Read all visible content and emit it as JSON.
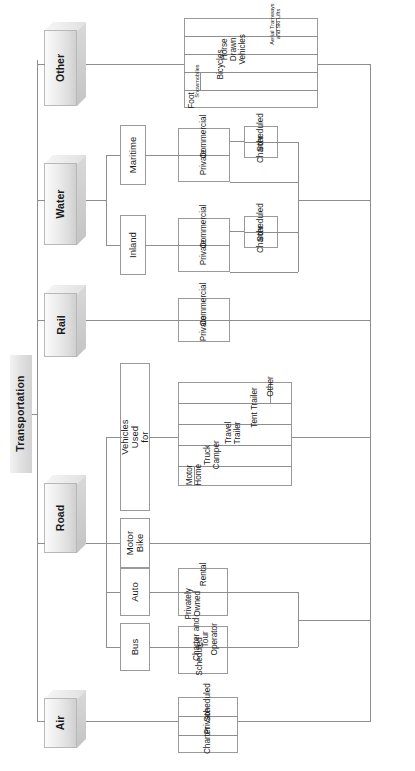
{
  "diagram": {
    "title": "Transportation",
    "orientation": "rotated-90",
    "type": "hierarchy-tree",
    "root": "Transportation",
    "colors": {
      "line": "#8e8e8e",
      "box_border": "#9a9a9a",
      "box_fill": "#ffffff",
      "level1_fill": "#e6e6e6",
      "text": "#1a1a1a"
    },
    "branches": [
      {
        "label": "Air",
        "children": [],
        "leaves": [
          "Charter",
          "Private",
          "Scheduled"
        ]
      },
      {
        "label": "Road",
        "children": [
          {
            "label": "Bus",
            "leaves": [
              "Scheduled",
              "Charter and Tour Operator"
            ]
          },
          {
            "label": "Auto",
            "leaves": [
              "Privately Owned",
              "Rental"
            ]
          },
          {
            "label": "Motor Bike",
            "leaves": []
          },
          {
            "label": "Vehicles Used for",
            "leaves": [
              "Motor Home",
              "Truck Camper",
              "Travel Trailer",
              "Tent Trailer",
              "Other"
            ]
          }
        ],
        "leaves": []
      },
      {
        "label": "Rail",
        "children": [],
        "leaves": [
          "Private",
          "Commercial"
        ]
      },
      {
        "label": "Water",
        "children": [
          {
            "label": "Inland",
            "leaves": [
              "Private",
              "Commercial"
            ],
            "subleaves": [
              "Charter",
              "Scheduled"
            ]
          },
          {
            "label": "Maritime",
            "leaves": [
              "Private",
              "Commercial"
            ],
            "subleaves": [
              "Charter",
              "Scheduled"
            ]
          }
        ],
        "leaves": []
      },
      {
        "label": "Other",
        "children": [],
        "leaves": [
          "Foot",
          "Snowmobiles",
          "Bicycles",
          "Horse Drawn Vehicles",
          "Aerial Tramways and Ski Lifts"
        ]
      }
    ]
  },
  "labels": {
    "root": "Transportation",
    "air": "Air",
    "road": "Road",
    "rail": "Rail",
    "water": "Water",
    "other": "Other",
    "bus": "Bus",
    "auto": "Auto",
    "motor_bike": "Motor Bike",
    "vehicles_used_for": "Vehicles Used for",
    "inland": "Inland",
    "maritime": "Maritime",
    "air_charter": "Charter",
    "air_private": "Private",
    "air_scheduled": "Scheduled",
    "bus_scheduled": "Scheduled",
    "bus_charter_tour": "Charter and Tour Operator",
    "auto_privately_owned": "Privately Owned",
    "auto_rental": "Rental",
    "veh_motor_home": "Motor Home",
    "veh_truck_camper": "Truck Camper",
    "veh_travel_trailer": "Travel Trailer",
    "veh_tent_trailer": "Tent Trailer",
    "veh_other": "Other",
    "rail_private": "Private",
    "rail_commercial": "Commercial",
    "inland_private": "Private",
    "inland_commercial": "Commercial",
    "inland_charter": "Charter",
    "inland_scheduled": "Scheduled",
    "maritime_private": "Private",
    "maritime_commercial": "Commercial",
    "maritime_charter": "Charter",
    "maritime_scheduled": "Scheduled",
    "other_foot": "Foot",
    "other_snowmobiles": "Snowmobiles",
    "other_bicycles": "Bicycles",
    "other_horse_drawn": "Horse Drawn Vehicles",
    "other_aerial": "Aerial Tramways and Ski Lifts"
  }
}
